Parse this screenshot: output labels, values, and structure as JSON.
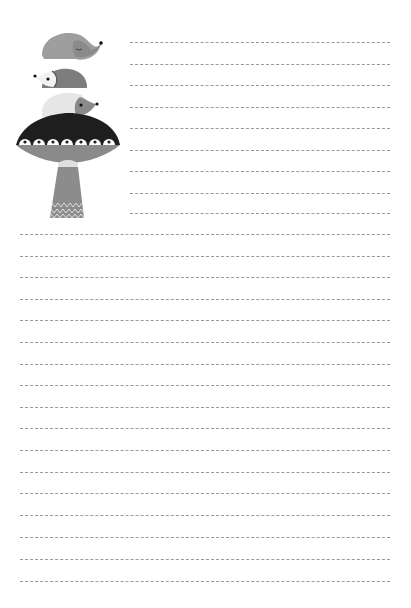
{
  "page": {
    "type": "lined-stationery",
    "background": "#ffffff",
    "line_color": "#9a9a9a",
    "line_style": "dashed"
  },
  "illustration": {
    "subject": "three hedgehogs stacked on a mushroom",
    "hedgehogs": [
      {
        "position": "top",
        "color": "#9e9e9e",
        "facing": "right"
      },
      {
        "position": "middle",
        "color": "#7d7d7d",
        "facing": "left"
      },
      {
        "position": "bottom",
        "color": "#e6e6e6",
        "facing": "right"
      }
    ],
    "mushroom": {
      "cap_color": "#1e1e1e",
      "underside_color": "#8a8a8a",
      "stem_color": "#8c8c8c",
      "dot_count": 7
    }
  },
  "lines": {
    "short": {
      "x_start": 130,
      "x_end": 390,
      "y": [
        42,
        64,
        85,
        107,
        128,
        150,
        171,
        193,
        213
      ]
    },
    "full": {
      "x_start": 20,
      "x_end": 390,
      "y": [
        234,
        256,
        277,
        299,
        320,
        342,
        364,
        385,
        407,
        428,
        450,
        472,
        493,
        515,
        537,
        559,
        581
      ]
    }
  }
}
